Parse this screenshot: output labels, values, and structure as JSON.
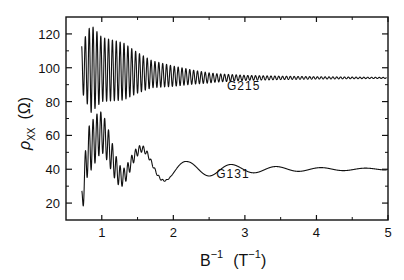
{
  "chart_data": {
    "type": "line",
    "title": "",
    "xlabel": "B⁻¹ (T⁻¹)",
    "xlabel_parts": {
      "base": "B",
      "sup": "−1",
      "unit_base": "(T",
      "unit_sup": "−1",
      "unit_close": ")"
    },
    "ylabel": "ρxx (Ω)",
    "ylabel_parts": {
      "symbol": "ρ",
      "sub": "XX",
      "unit": "(Ω)"
    },
    "xlim": [
      0.5,
      5
    ],
    "ylim": [
      10,
      130
    ],
    "xticks": [
      1,
      2,
      3,
      4,
      5
    ],
    "xtick_labels": [
      "1",
      "2",
      "3",
      "4",
      "5"
    ],
    "xminor_ticks": [
      1.5,
      2.5,
      3.5,
      4.5
    ],
    "yticks": [
      20,
      40,
      60,
      80,
      100,
      120
    ],
    "ytick_labels": [
      "20",
      "40",
      "60",
      "80",
      "100",
      "120"
    ],
    "yminor_ticks": [
      30,
      50,
      70,
      90,
      110
    ],
    "grid": false,
    "legend": "none",
    "annotations": [
      {
        "text": "G215",
        "x": 2.75,
        "y": 87
      },
      {
        "text": "G131",
        "x": 2.6,
        "y": 35
      }
    ],
    "series": [
      {
        "name": "G215",
        "x_start": 0.72,
        "x_end": 4.98,
        "fast_frequency_per_T": 18.5,
        "mean_points": {
          "x": [
            0.72,
            1.0,
            1.5,
            2.0,
            2.5,
            3.0,
            4.0,
            5.0
          ],
          "y": [
            100,
            99,
            97,
            95,
            94,
            94,
            94,
            94
          ]
        },
        "amplitude_points": {
          "x": [
            0.72,
            0.85,
            1.0,
            1.3,
            1.5,
            1.7,
            2.0,
            2.3,
            2.6,
            3.0,
            3.5,
            4.0,
            5.0
          ],
          "y": [
            14,
            26,
            19,
            17,
            12,
            8,
            6,
            4,
            2.5,
            1.5,
            1.0,
            0.7,
            0.3
          ]
        }
      },
      {
        "name": "G131",
        "x_start": 0.72,
        "x_end": 4.98,
        "slow_frequency_per_T": 1.6,
        "fast_frequency_per_T": 18.5,
        "mean_points": {
          "x": [
            0.72,
            0.8,
            1.0,
            1.5,
            2.0,
            3.0,
            4.0,
            5.0
          ],
          "y": [
            20,
            50,
            55,
            42,
            40,
            40,
            40,
            40
          ]
        },
        "slow_amplitude_points": {
          "x": [
            0.72,
            1.0,
            1.3,
            1.6,
            1.9,
            2.2,
            2.5,
            2.9,
            3.5,
            4.0,
            5.0
          ],
          "y": [
            0,
            8,
            13,
            10,
            7,
            4.5,
            4.0,
            2.5,
            1.5,
            1.0,
            0.5
          ]
        },
        "fast_amplitude_points": {
          "x": [
            0.72,
            0.8,
            0.9,
            1.1,
            1.3,
            1.5,
            1.7,
            2.0
          ],
          "y": [
            8,
            14,
            14,
            10,
            5,
            2.5,
            1,
            0
          ]
        },
        "key_extrema": [
          {
            "x": 0.85,
            "y": 75,
            "kind": "max"
          },
          {
            "x": 1.27,
            "y": 27,
            "kind": "min"
          },
          {
            "x": 1.57,
            "y": 52,
            "kind": "max"
          },
          {
            "x": 1.91,
            "y": 33,
            "kind": "min"
          },
          {
            "x": 2.2,
            "y": 44,
            "kind": "max"
          },
          {
            "x": 2.51,
            "y": 36,
            "kind": "min"
          },
          {
            "x": 2.9,
            "y": 42,
            "kind": "max"
          }
        ]
      }
    ]
  }
}
